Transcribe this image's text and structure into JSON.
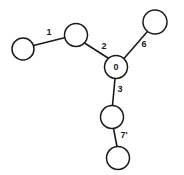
{
  "diagram": {
    "type": "graph-tree",
    "background_color": "#ffffff",
    "stroke_color": "#1a1a1a",
    "node_fill": "#ffffff",
    "nodes": [
      {
        "id": "n-left-end",
        "label": "",
        "cx": 23,
        "cy": 49,
        "r": 11
      },
      {
        "id": "n-upper-left",
        "label": "",
        "cx": 76,
        "cy": 35,
        "r": 11.5
      },
      {
        "id": "n-center",
        "label": "0",
        "cx": 116,
        "cy": 67,
        "r": 11.5
      },
      {
        "id": "n-upper-right",
        "label": "",
        "cx": 155,
        "cy": 22,
        "r": 12
      },
      {
        "id": "n-lower-mid",
        "label": "",
        "cx": 112,
        "cy": 117,
        "r": 11.5
      },
      {
        "id": "n-bottom",
        "label": "",
        "cx": 118,
        "cy": 158,
        "r": 11.5
      }
    ],
    "edges": [
      {
        "id": "e1",
        "from": "n-left-end",
        "to": "n-upper-left",
        "label": "1",
        "label_x": 49,
        "label_y": 33
      },
      {
        "id": "e2",
        "from": "n-upper-left",
        "to": "n-center",
        "label": "2",
        "label_x": 104,
        "label_y": 47
      },
      {
        "id": "e6",
        "from": "n-center",
        "to": "n-upper-right",
        "label": "6",
        "label_x": 144,
        "label_y": 45
      },
      {
        "id": "e3",
        "from": "n-center",
        "to": "n-lower-mid",
        "label": "3",
        "label_x": 120,
        "label_y": 90
      },
      {
        "id": "e7",
        "from": "n-lower-mid",
        "to": "n-bottom",
        "label": "7'",
        "label_x": 124,
        "label_y": 136
      }
    ]
  }
}
